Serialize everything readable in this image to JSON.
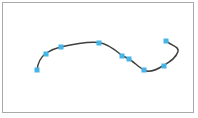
{
  "canvas": {
    "background": "#ffffff",
    "frame_border_color": "#a9a9a9"
  },
  "curve": {
    "color": "#3f3f3f",
    "stroke_width": 1.5,
    "path": "M 37 70 C 37.8 63.5 41 57 45.5 53.5 C 50 50.5 55 48.3 60.5 47 C 70 44.8 88 41.2 99 42.5 C 108 43.6 116 50.5 122 55.5 C 124.3 56.7 126.7 57.9 129 59 C 131.5 60.3 138.5 66.5 143.5 70 C 149 73.2 157.5 69.3 163.5 65.5 C 169 62.2 176 58.5 178 51.5 C 179.3 46 170.8 46.2 166 40.5"
  },
  "anchor": {
    "color": "#45b5e6",
    "size_px": 5
  },
  "points": [
    {
      "x": 37,
      "y": 70
    },
    {
      "x": 45.5,
      "y": 53.5
    },
    {
      "x": 60.5,
      "y": 47
    },
    {
      "x": 99,
      "y": 42.5
    },
    {
      "x": 122,
      "y": 55.5
    },
    {
      "x": 129,
      "y": 59
    },
    {
      "x": 143.5,
      "y": 70
    },
    {
      "x": 163.5,
      "y": 65.5
    },
    {
      "x": 166,
      "y": 40.5
    }
  ]
}
